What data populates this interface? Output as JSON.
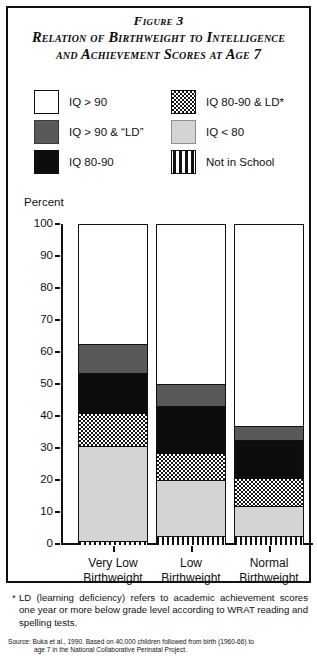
{
  "figure": {
    "title_line1": "Figure 3",
    "title_line2": "Relation of Birthweight to Intelligence",
    "title_line3": "and Achievement Scores at Age 7"
  },
  "legend": {
    "items": [
      {
        "label": "IQ > 90",
        "pattern": "white",
        "color": "#ffffff"
      },
      {
        "label": "IQ > 90 & “LD”",
        "pattern": "darkgray",
        "color": "#595959"
      },
      {
        "label": "IQ 80-90",
        "pattern": "black",
        "color": "#0d0d0d"
      },
      {
        "label": "IQ 80-90 & LD*",
        "pattern": "check",
        "color": "#141414"
      },
      {
        "label": "IQ < 80",
        "pattern": "lightgray",
        "color": "#d4d4d4"
      },
      {
        "label": "Not in School",
        "pattern": "stripe",
        "color": "#111111"
      }
    ]
  },
  "axis": {
    "y_title": "Percent",
    "ticks": [
      "100",
      "90",
      "80",
      "70",
      "60",
      "50",
      "40",
      "30",
      "20",
      "10",
      "0"
    ]
  },
  "xlabels": [
    {
      "line1": "Very Low",
      "line2": "Birthweight"
    },
    {
      "line1": "Low",
      "line2": "Birthweight"
    },
    {
      "line1": "Normal",
      "line2": "Birthweight"
    }
  ],
  "footnote": {
    "marker": "*",
    "text": "LD (learning deficiency) refers to academic achievement scores one year or more below grade level according to WRAT reading and spelling tests."
  },
  "source": {
    "line1": "Source: Buka et al., 1990. Based on 40,000 children followed from birth (1960-66) to",
    "line2": "age 7 in the National Collaborative Perinatal Project."
  },
  "chart_data": {
    "type": "bar",
    "subtype": "stacked-column",
    "title": "Relation of Birthweight to Intelligence and Achievement Scores at Age 7",
    "xlabel": "",
    "ylabel": "Percent",
    "ylim": [
      0,
      100
    ],
    "yticks": [
      0,
      10,
      20,
      30,
      40,
      50,
      60,
      70,
      80,
      90,
      100
    ],
    "grid": false,
    "legend_position": "top",
    "categories": [
      "Very Low Birthweight",
      "Low Birthweight",
      "Normal Birthweight"
    ],
    "series": [
      {
        "name": "IQ > 90",
        "pattern": "white",
        "values": [
          37.5,
          50.0,
          63.0
        ]
      },
      {
        "name": "IQ > 90 & “LD”",
        "pattern": "darkgray",
        "values": [
          9.0,
          7.0,
          4.5
        ]
      },
      {
        "name": "IQ 80-90",
        "pattern": "black",
        "values": [
          12.5,
          14.5,
          12.0
        ]
      },
      {
        "name": "IQ 80-90 & LD*",
        "pattern": "check",
        "values": [
          10.5,
          8.5,
          8.5
        ]
      },
      {
        "name": "IQ < 80",
        "pattern": "lightgray",
        "values": [
          29.5,
          17.5,
          9.5
        ]
      },
      {
        "name": "Not in School",
        "pattern": "stripe",
        "values": [
          1.0,
          2.5,
          2.5
        ]
      }
    ],
    "stack_order_bottom_to_top": [
      "Not in School",
      "IQ < 80",
      "IQ 80-90 & LD*",
      "IQ 80-90",
      "IQ > 90 & “LD”",
      "IQ > 90"
    ]
  }
}
